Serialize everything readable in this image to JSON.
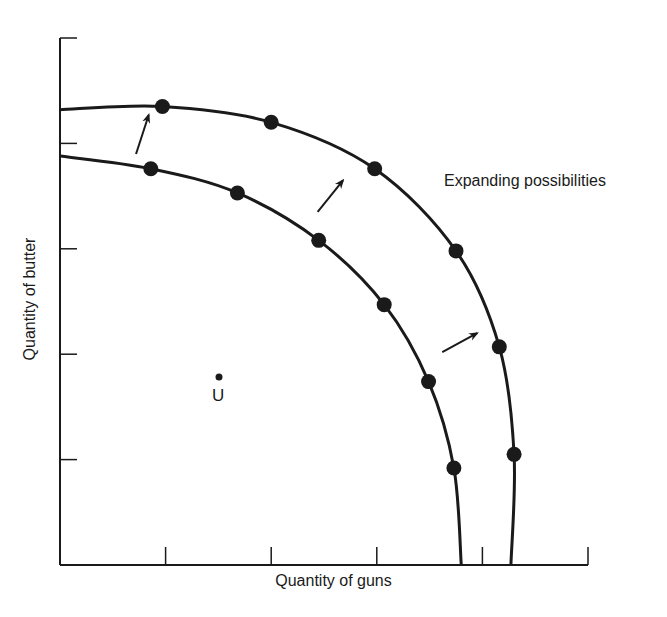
{
  "chart_data": {
    "type": "line",
    "title": "",
    "xlabel": "Quantity of guns",
    "ylabel": "Quantity of butter",
    "xlim": [
      0,
      5
    ],
    "ylim": [
      0,
      5
    ],
    "x_ticks": [
      1,
      2,
      3,
      4,
      5
    ],
    "y_ticks": [
      1,
      2,
      3,
      4,
      5
    ],
    "tick_labels_shown": false,
    "grid": false,
    "annotations": [
      {
        "text": "Expanding possibilities",
        "x": 3.6,
        "y": 3.6
      },
      {
        "text": "U",
        "x": 1.5,
        "y": 1.8,
        "marker": "point"
      }
    ],
    "series": [
      {
        "name": "Original production possibility frontier",
        "x": [
          0,
          0.86,
          1.68,
          2.45,
          3.07,
          3.49,
          3.73,
          3.8
        ],
        "y": [
          3.88,
          3.76,
          3.53,
          3.08,
          2.47,
          1.74,
          0.92,
          0
        ],
        "marked_points": [
          [
            0.86,
            3.76
          ],
          [
            1.68,
            3.53
          ],
          [
            2.45,
            3.08
          ],
          [
            3.07,
            2.47
          ],
          [
            3.49,
            1.74
          ],
          [
            3.73,
            0.92
          ]
        ]
      },
      {
        "name": "Expanded production possibility frontier",
        "x": [
          0,
          0.97,
          2.0,
          2.98,
          3.75,
          4.16,
          4.3,
          4.27
        ],
        "y": [
          4.32,
          4.35,
          4.2,
          3.76,
          2.98,
          2.07,
          1.05,
          0
        ],
        "marked_points": [
          [
            0.97,
            4.35
          ],
          [
            2.0,
            4.2
          ],
          [
            2.98,
            3.76
          ],
          [
            3.75,
            2.98
          ],
          [
            4.16,
            2.07
          ],
          [
            4.3,
            1.05
          ]
        ]
      }
    ],
    "arrows": [
      {
        "from": [
          0.72,
          3.9
        ],
        "to": [
          0.84,
          4.27
        ]
      },
      {
        "from": [
          2.44,
          3.35
        ],
        "to": [
          2.68,
          3.65
        ]
      },
      {
        "from": [
          3.62,
          2.02
        ],
        "to": [
          3.95,
          2.2
        ]
      }
    ]
  },
  "labels": {
    "xlabel": "Quantity of guns",
    "ylabel": "Quantity of butter",
    "annotation": "Expanding possibilities",
    "point_u": "U"
  },
  "colors": {
    "ink": "#1a1a1a",
    "background": "#ffffff"
  }
}
